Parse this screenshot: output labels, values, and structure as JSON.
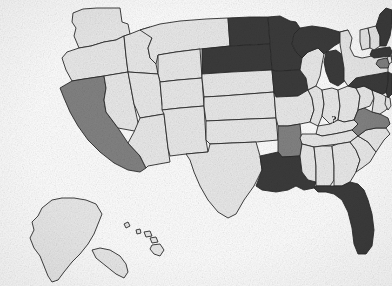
{
  "map": {
    "title": "United States state-level shaded map",
    "projection_note": "Albers-style composite with Alaska and Hawaii insets",
    "background_color": "#ffffff",
    "border_color": "#2b2b2b",
    "legend_tiers": [
      {
        "key": "none",
        "label": "Unshaded",
        "color": "#e9e9e9"
      },
      {
        "key": "mid",
        "label": "Medium shading",
        "color": "#828282"
      },
      {
        "key": "high",
        "label": "Dark shading",
        "color": "#3a3a3a"
      }
    ],
    "annotations": [
      {
        "id": "virginia-question",
        "text": "?",
        "state": "Virginia",
        "x": 334,
        "y": 123
      }
    ],
    "states": [
      {
        "code": "WA",
        "name": "Washington",
        "tier": "none"
      },
      {
        "code": "OR",
        "name": "Oregon",
        "tier": "none"
      },
      {
        "code": "CA",
        "name": "California",
        "tier": "mid"
      },
      {
        "code": "NV",
        "name": "Nevada",
        "tier": "none"
      },
      {
        "code": "ID",
        "name": "Idaho",
        "tier": "none"
      },
      {
        "code": "MT",
        "name": "Montana",
        "tier": "none"
      },
      {
        "code": "WY",
        "name": "Wyoming",
        "tier": "none"
      },
      {
        "code": "UT",
        "name": "Utah",
        "tier": "none"
      },
      {
        "code": "AZ",
        "name": "Arizona",
        "tier": "none"
      },
      {
        "code": "CO",
        "name": "Colorado",
        "tier": "none"
      },
      {
        "code": "NM",
        "name": "New Mexico",
        "tier": "none"
      },
      {
        "code": "ND",
        "name": "North Dakota",
        "tier": "high"
      },
      {
        "code": "SD",
        "name": "South Dakota",
        "tier": "high"
      },
      {
        "code": "NE",
        "name": "Nebraska",
        "tier": "none"
      },
      {
        "code": "KS",
        "name": "Kansas",
        "tier": "none"
      },
      {
        "code": "OK",
        "name": "Oklahoma",
        "tier": "none"
      },
      {
        "code": "TX",
        "name": "Texas",
        "tier": "none"
      },
      {
        "code": "MN",
        "name": "Minnesota",
        "tier": "high"
      },
      {
        "code": "IA",
        "name": "Iowa",
        "tier": "high"
      },
      {
        "code": "MO",
        "name": "Missouri",
        "tier": "none"
      },
      {
        "code": "AR",
        "name": "Arkansas",
        "tier": "mid"
      },
      {
        "code": "LA",
        "name": "Louisiana",
        "tier": "high"
      },
      {
        "code": "WI",
        "name": "Wisconsin",
        "tier": "none"
      },
      {
        "code": "IL",
        "name": "Illinois",
        "tier": "none"
      },
      {
        "code": "MI",
        "name": "Michigan",
        "tier": "high"
      },
      {
        "code": "IN",
        "name": "Indiana",
        "tier": "none"
      },
      {
        "code": "OH",
        "name": "Ohio",
        "tier": "none"
      },
      {
        "code": "KY",
        "name": "Kentucky",
        "tier": "none"
      },
      {
        "code": "TN",
        "name": "Tennessee",
        "tier": "none"
      },
      {
        "code": "MS",
        "name": "Mississippi",
        "tier": "none"
      },
      {
        "code": "AL",
        "name": "Alabama",
        "tier": "none"
      },
      {
        "code": "GA",
        "name": "Georgia",
        "tier": "none"
      },
      {
        "code": "FL",
        "name": "Florida",
        "tier": "high"
      },
      {
        "code": "SC",
        "name": "South Carolina",
        "tier": "none"
      },
      {
        "code": "NC",
        "name": "North Carolina",
        "tier": "none"
      },
      {
        "code": "VA",
        "name": "Virginia",
        "tier": "mid"
      },
      {
        "code": "WV",
        "name": "West Virginia",
        "tier": "none"
      },
      {
        "code": "MD",
        "name": "Maryland",
        "tier": "none"
      },
      {
        "code": "DE",
        "name": "Delaware",
        "tier": "none"
      },
      {
        "code": "PA",
        "name": "Pennsylvania",
        "tier": "high"
      },
      {
        "code": "NJ",
        "name": "New Jersey",
        "tier": "high"
      },
      {
        "code": "NY",
        "name": "New York",
        "tier": "none"
      },
      {
        "code": "CT",
        "name": "Connecticut",
        "tier": "mid"
      },
      {
        "code": "RI",
        "name": "Rhode Island",
        "tier": "none"
      },
      {
        "code": "MA",
        "name": "Massachusetts",
        "tier": "high"
      },
      {
        "code": "VT",
        "name": "Vermont",
        "tier": "none"
      },
      {
        "code": "NH",
        "name": "New Hampshire",
        "tier": "none"
      },
      {
        "code": "ME",
        "name": "Maine",
        "tier": "high"
      },
      {
        "code": "AK",
        "name": "Alaska",
        "tier": "none"
      },
      {
        "code": "HI",
        "name": "Hawaii",
        "tier": "none"
      }
    ]
  }
}
